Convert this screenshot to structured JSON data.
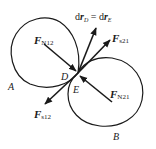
{
  "figure": {
    "bodies": [
      {
        "label": "A"
      },
      {
        "label": "B"
      }
    ],
    "points": [
      {
        "label": "D"
      },
      {
        "label": "E"
      }
    ],
    "vectors": {
      "normal_12": {
        "symbol": "F",
        "subscript": "N12"
      },
      "normal_21": {
        "symbol": "F",
        "subscript": "N21"
      },
      "friction_21": {
        "symbol": "F",
        "subscript": "s21"
      },
      "friction_12": {
        "symbol": "F",
        "subscript": "s12"
      },
      "displacement": {
        "left_d": "d",
        "left_r": "r",
        "left_sub": "D",
        "equals": " = ",
        "right_d": "d",
        "right_r": "r",
        "right_sub": "E"
      }
    },
    "colors": {
      "stroke": "#1a1a1a",
      "background": "#ffffff"
    }
  }
}
